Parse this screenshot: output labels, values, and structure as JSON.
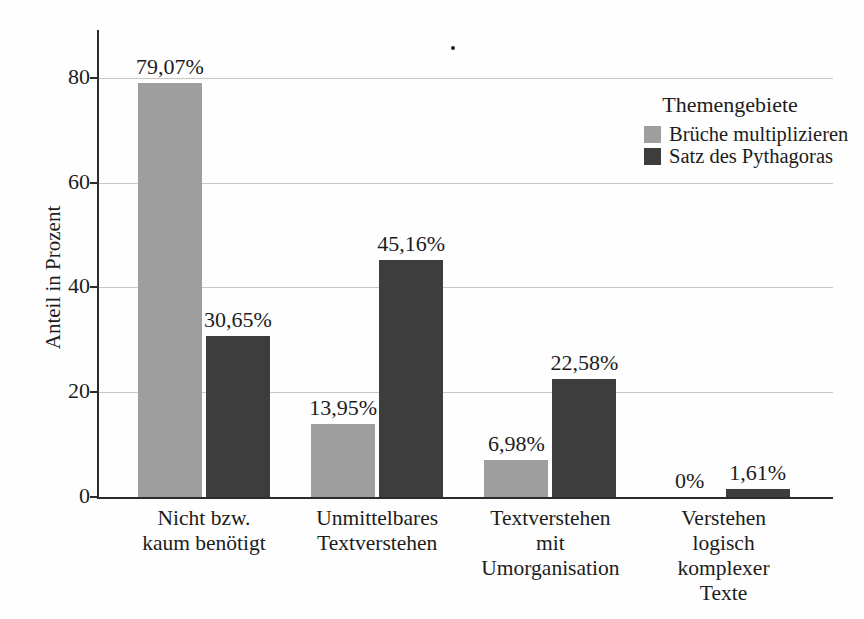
{
  "chart_data": {
    "type": "bar",
    "title": "",
    "xlabel": "",
    "ylabel": "Anteil in Prozent",
    "ylim": [
      0,
      89
    ],
    "yticks": [
      0,
      20,
      40,
      60,
      80
    ],
    "ytick_labels": [
      "0",
      "20",
      "40",
      "60",
      "80"
    ],
    "grid": true,
    "legend_title": "Themengebiete",
    "legend_position": "top-right",
    "categories": [
      "Nicht bzw.\nkaum benötigt",
      "Unmittelbares\nTextverstehen",
      "Textverstehen\nmit\nUmorganisation",
      "Verstehen\nlogisch\nkomplexer\nTexte"
    ],
    "series": [
      {
        "name": "Brüche multiplizieren",
        "color": "#9e9e9e",
        "values": [
          79.07,
          13.95,
          6.98,
          0
        ],
        "value_labels": [
          "79,07%",
          "13,95%",
          "6,98%",
          "0%"
        ]
      },
      {
        "name": "Satz des Pythagoras",
        "color": "#3d3d3d",
        "values": [
          30.65,
          45.16,
          22.58,
          1.61
        ],
        "value_labels": [
          "30,65%",
          "45,16%",
          "22,58%",
          "1,61%"
        ]
      }
    ]
  },
  "colors": {
    "background": "#fefefe",
    "axis": "#2b2b2b",
    "gridline": "#c7c7c7",
    "text": "#1c1c1c"
  }
}
